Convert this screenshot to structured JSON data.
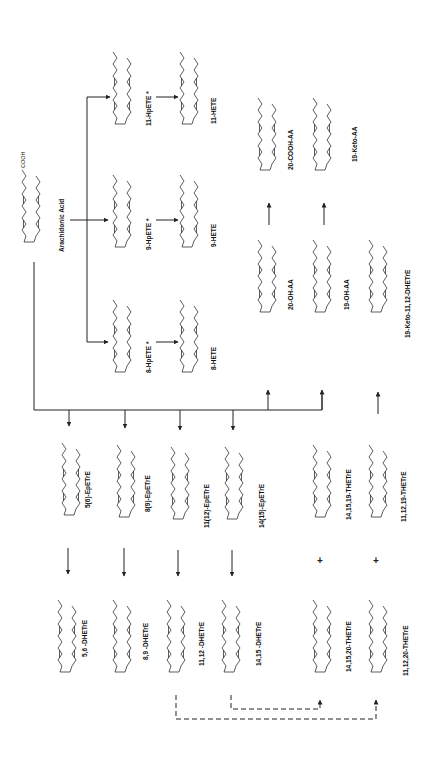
{
  "orientation": "rotated 90deg counter-clockwise",
  "colors": {
    "line": "#222222",
    "background": "#ffffff"
  },
  "substrate": {
    "label": "Arachidonic Acid",
    "group": "COOH"
  },
  "hydroperoxides": [
    {
      "label": "8-HpETE *",
      "group": "OOH"
    },
    {
      "label": "9-HpETE *",
      "group": "OOH"
    },
    {
      "label": "11-HpETE *",
      "group": "HOO"
    }
  ],
  "hetes": [
    {
      "label": "8-HETE",
      "group": "OH"
    },
    {
      "label": "9-HETE",
      "group": "OH"
    },
    {
      "label": "11-HETE",
      "group": "HO"
    }
  ],
  "omega_oxidation": [
    {
      "label": "20-OH-AA",
      "group": "CH2OH",
      "product_label": "20-COOH-AA",
      "product_group": "COOH"
    },
    {
      "label": "19-OH-AA",
      "group": "OH",
      "product_label": "19-Keto-AA",
      "product_group": "O"
    },
    {
      "label": "19-Keto-11,12-DHETrE",
      "group": "O"
    }
  ],
  "epoxides": [
    {
      "label": "5(6)-EpETrE"
    },
    {
      "label": "8(9)-EpETrE"
    },
    {
      "label": "11(12)-EpETrE"
    },
    {
      "label": "14(15)-EpETrE"
    }
  ],
  "diols": [
    {
      "label": "5,6 -DHETrE"
    },
    {
      "label": "8,9 -DHETrE"
    },
    {
      "label": "11,12 -DHETrE"
    },
    {
      "label": "14,15 -DHETrE"
    }
  ],
  "triols": [
    {
      "label": "14,15,19-THETrE"
    },
    {
      "label": "11,12,19-THETrE"
    },
    {
      "label": "14,15,20-THETrE"
    },
    {
      "label": "11,12,20-THETrE"
    }
  ],
  "symbols": {
    "plus": "+",
    "cooh": "COOH",
    "oh": "OH",
    "ho": "HO",
    "o": "O"
  }
}
